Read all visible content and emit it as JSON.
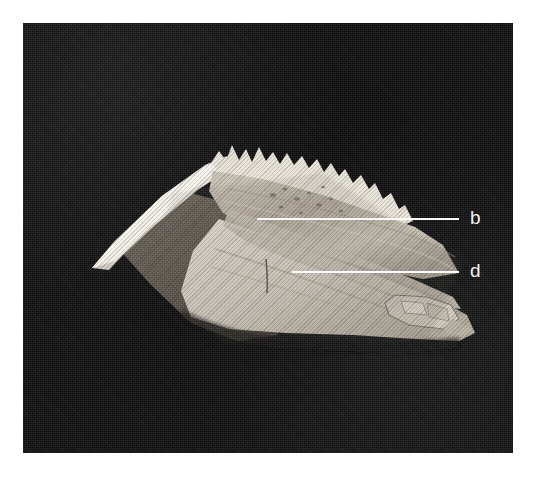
{
  "figure": {
    "type": "photographic-plate",
    "caption": "",
    "plate": {
      "background_color": "#0d0d0d",
      "left": 23,
      "top": 23,
      "width": 490,
      "height": 430
    },
    "specimen": {
      "name": "bone-specimen",
      "description": "pale bone fragment with sharp anterior spine and serrated dorsal crest, photographed against a black background",
      "highlight_color": "#f0ece3",
      "midtone_color": "#bab3a6",
      "shadow_color": "#5c554d"
    },
    "labels": [
      {
        "id": "b",
        "text": "b",
        "label_x": 470,
        "label_y": 208,
        "leader": {
          "x1": 257,
          "y1": 219,
          "x2": 459,
          "y2": 219
        },
        "leader_color": "#ffffff"
      },
      {
        "id": "d",
        "text": "d",
        "label_x": 470,
        "label_y": 261,
        "leader": {
          "x1": 292,
          "y1": 272,
          "x2": 459,
          "y2": 272
        },
        "leader_color": "#ffffff"
      }
    ]
  }
}
